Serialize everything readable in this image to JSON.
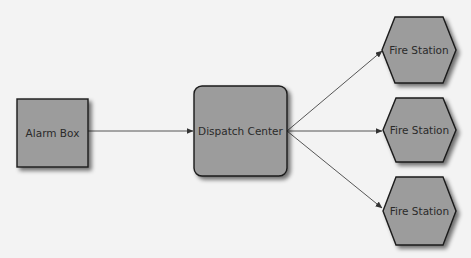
{
  "diagram": {
    "type": "flowchart",
    "colors": {
      "background": "#f3f3f3",
      "node_fill": "#9c9c9c",
      "node_stroke": "#1a1a1a",
      "edge": "#444444",
      "text": "#2a2a2a"
    },
    "nodes": [
      {
        "id": "alarm",
        "label": "Alarm Box",
        "shape": "square"
      },
      {
        "id": "dispatch",
        "label": "Dispatch Center",
        "shape": "rounded-rect"
      },
      {
        "id": "fs1",
        "label": "Fire Station",
        "shape": "hexagon"
      },
      {
        "id": "fs2",
        "label": "Fire Station",
        "shape": "hexagon"
      },
      {
        "id": "fs3",
        "label": "Fire Station",
        "shape": "hexagon"
      }
    ],
    "edges": [
      {
        "from": "alarm",
        "to": "dispatch"
      },
      {
        "from": "dispatch",
        "to": "fs1"
      },
      {
        "from": "dispatch",
        "to": "fs2"
      },
      {
        "from": "dispatch",
        "to": "fs3"
      }
    ]
  }
}
